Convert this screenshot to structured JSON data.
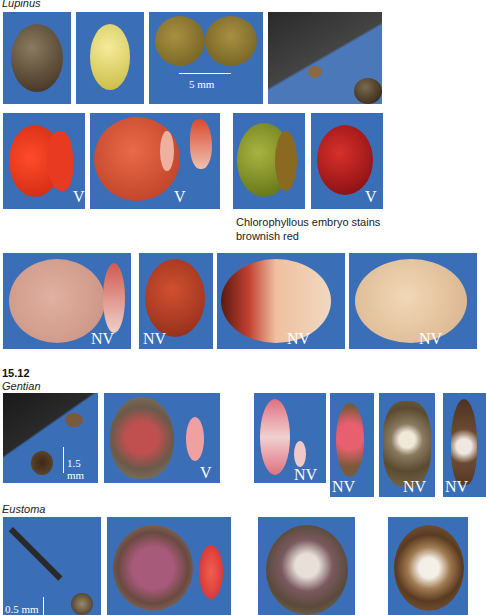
{
  "section_lupinus": {
    "title": "Lupinus",
    "scale_label": "5 mm",
    "viable_label": "V",
    "nonviable_label": "NV",
    "caption_line1": "Chlorophyllous embryo stains",
    "caption_line2": "brownish red"
  },
  "section_gentian": {
    "figure_number": "15.12",
    "title": "Gentian",
    "scale_label": "1.5 mm",
    "viable_label": "V",
    "nonviable_label": "NV"
  },
  "section_eustoma": {
    "title": "Eustoma",
    "scale_label": "0.5 mm"
  },
  "colors": {
    "panel_blue": "#3a6fb8",
    "stain_red": "#d8341e",
    "seed_brown": "#6b4a2a",
    "seed_yellow": "#e8d860",
    "embryo_green": "#8a9a2a",
    "pale_pink": "#e8b8a8"
  }
}
